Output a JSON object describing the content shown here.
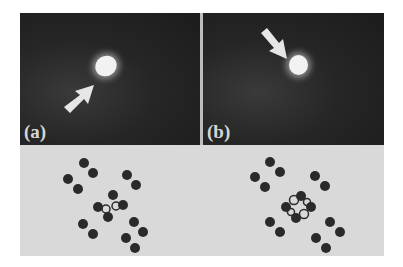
{
  "figure": {
    "panels": [
      {
        "id": "a",
        "label": "(a)"
      },
      {
        "id": "b",
        "label": "(b)"
      }
    ],
    "colors": {
      "stm_background": "#262626",
      "bright_spot": "#f2f2f2",
      "schematic_background": "#d9d9d9",
      "molecule_atom": "#2a2a2a"
    }
  }
}
